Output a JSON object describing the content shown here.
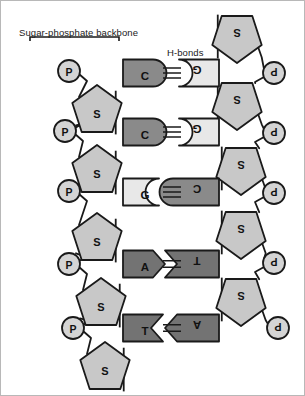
{
  "figure": {
    "type": "dna-ladder-diagram",
    "width": 305,
    "height": 396
  },
  "annotations": {
    "backbone_label": "Sugar-phosphate backbone",
    "hbonds_label": "H-bonds"
  },
  "colors": {
    "phosphate_fill": "#d4d4d4",
    "sugar_fill": "#c8c8c8",
    "base_light": "#e8e8e8",
    "base_mid": "#8a8a8a",
    "base_dark": "#737373",
    "stroke": "#1a1a1a",
    "background": "#ffffff",
    "text": "#111111"
  },
  "left_strand": {
    "phosphate_label": "P",
    "sugar_label": "S",
    "phosphates": [
      {
        "label": "P",
        "cx": 68,
        "cy": 70
      },
      {
        "label": "P",
        "cx": 64,
        "cy": 130
      },
      {
        "label": "P",
        "cx": 68,
        "cy": 190
      },
      {
        "label": "P",
        "cx": 68,
        "cy": 263
      },
      {
        "label": "P",
        "cx": 72,
        "cy": 327
      }
    ],
    "sugars": [
      {
        "label": "S",
        "cx": 96,
        "cy": 110
      },
      {
        "label": "S",
        "cx": 96,
        "cy": 170
      },
      {
        "label": "S",
        "cx": 96,
        "cy": 238
      },
      {
        "label": "S",
        "cx": 100,
        "cy": 303
      },
      {
        "label": "S",
        "cx": 104,
        "cy": 367
      }
    ]
  },
  "right_strand": {
    "phosphate_label": "P",
    "sugar_label": "S",
    "phosphates": [
      {
        "label": "P",
        "cx": 273,
        "cy": 72
      },
      {
        "label": "P",
        "cx": 273,
        "cy": 132
      },
      {
        "label": "P",
        "cx": 273,
        "cy": 192
      },
      {
        "label": "P",
        "cx": 273,
        "cy": 262
      },
      {
        "label": "P",
        "cx": 277,
        "cy": 327
      }
    ],
    "sugars": [
      {
        "label": "S",
        "cx": 236,
        "cy": 36
      },
      {
        "label": "S",
        "cx": 236,
        "cy": 103
      },
      {
        "label": "S",
        "cx": 240,
        "cy": 168
      },
      {
        "label": "S",
        "cx": 240,
        "cy": 232
      },
      {
        "label": "S",
        "cx": 240,
        "cy": 299
      }
    ]
  },
  "base_pairs": [
    {
      "left_base": "C",
      "right_base": "G",
      "bonds": 3,
      "row_y": 72,
      "left_shade": "base_mid",
      "right_shade": "base_light",
      "connector": "lobe-left"
    },
    {
      "left_base": "C",
      "right_base": "G",
      "bonds": 3,
      "row_y": 131,
      "left_shade": "base_mid",
      "right_shade": "base_light",
      "connector": "lobe-left"
    },
    {
      "left_base": "G",
      "right_base": "C",
      "bonds": 3,
      "row_y": 191,
      "left_shade": "base_light",
      "right_shade": "base_mid",
      "connector": "lobe-right"
    },
    {
      "left_base": "A",
      "right_base": "T",
      "bonds": 2,
      "row_y": 263,
      "left_shade": "base_dark",
      "right_shade": "base_dark",
      "connector": "arrow-right"
    },
    {
      "left_base": "T",
      "right_base": "A",
      "bonds": 2,
      "row_y": 327,
      "left_shade": "base_dark",
      "right_shade": "base_dark",
      "connector": "arrow-left"
    }
  ]
}
